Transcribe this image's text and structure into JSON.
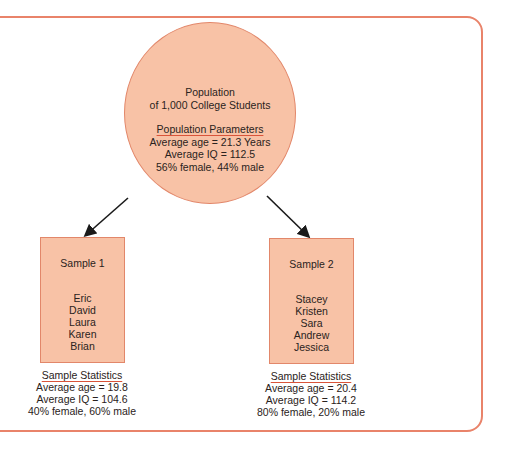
{
  "population": {
    "title_line1": "Population",
    "title_line2": "of 1,000 College Students",
    "params_heading": "Population Parameters",
    "params": [
      "Average age = 21.3 Years",
      "Average IQ = 112.5",
      "56% female, 44% male"
    ]
  },
  "samples": [
    {
      "title": "Sample 1",
      "names": [
        "Eric",
        "David",
        "Laura",
        "Karen",
        "Brian"
      ],
      "stats_heading": "Sample Statistics",
      "stats": [
        "Average age = 19.8",
        "Average IQ = 104.6",
        "40% female, 60% male"
      ]
    },
    {
      "title": "Sample 2",
      "names": [
        "Stacey",
        "Kristen",
        "Sara",
        "Andrew",
        "Jessica"
      ],
      "stats_heading": "Sample Statistics",
      "stats": [
        "Average age = 20.4",
        "Average IQ = 114.2",
        "80% female, 20% male"
      ]
    }
  ],
  "colors": {
    "fill": "#f8c2a6",
    "stroke": "#e2876a",
    "frame": "#e9836a",
    "underline": "#d9543a"
  }
}
